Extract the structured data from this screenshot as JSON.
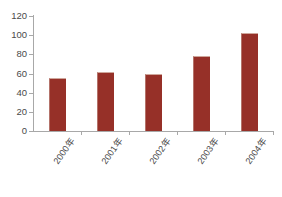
{
  "chart_data": {
    "type": "bar",
    "title": "",
    "subtitle": "",
    "xlabel": "",
    "ylabel": "",
    "categories": [
      "2000年",
      "2001年",
      "2002年",
      "2003年",
      "2004年"
    ],
    "values": [
      55,
      62,
      59,
      78,
      102
    ],
    "series": [
      {
        "name": "",
        "values": [
          55,
          62,
          59,
          78,
          102
        ]
      }
    ],
    "ylim": [
      0,
      120
    ],
    "yticks": [
      0,
      20,
      40,
      60,
      80,
      100,
      120
    ],
    "ytick_labels": [
      "0",
      "20",
      "40",
      "60",
      "80",
      "100",
      "120"
    ],
    "grid": false,
    "legend": "none",
    "bar_color": "#963028",
    "axis_color": "#a8a8a8",
    "text_color": "#4a4a4a",
    "background": "#ffffff"
  }
}
